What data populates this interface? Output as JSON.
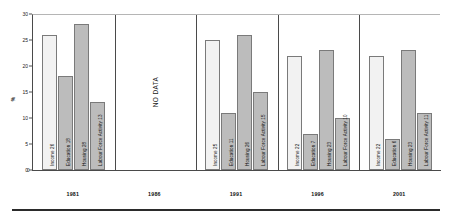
{
  "chart_data": {
    "type": "bar",
    "title": "",
    "xlabel": "",
    "ylabel": "%",
    "ylim": [
      0,
      30
    ],
    "ytick_labels": [
      "0",
      "5",
      "10",
      "15",
      "20",
      "25",
      "30"
    ],
    "ytick_values": [
      0,
      5,
      10,
      15,
      20,
      25,
      30
    ],
    "grid": false,
    "legend_position": "none",
    "categories": [
      "Income",
      "Education",
      "Housing",
      "Labour Force Activity"
    ],
    "groups": [
      {
        "year": "1981",
        "has_data": true,
        "bars": [
          {
            "label": "Income",
            "value": 26,
            "text": "Income  26",
            "shade": "light"
          },
          {
            "label": "Education",
            "value": 18,
            "text": "Education  18",
            "shade": "dark"
          },
          {
            "label": "Housing",
            "value": 28,
            "text": "Housing  28",
            "shade": "dark"
          },
          {
            "label": "Labour Force Activity",
            "value": 13,
            "text": "Labour Force Activity  13",
            "shade": "dark"
          }
        ]
      },
      {
        "year": "1986",
        "has_data": false,
        "no_data_text": "NO DATA",
        "bars": []
      },
      {
        "year": "1991",
        "has_data": true,
        "bars": [
          {
            "label": "Income",
            "value": 25,
            "text": "Income  25",
            "shade": "light"
          },
          {
            "label": "Education",
            "value": 11,
            "text": "Education  11",
            "shade": "dark"
          },
          {
            "label": "Housing",
            "value": 26,
            "text": "Housing  26",
            "shade": "dark"
          },
          {
            "label": "Labour Force Activity",
            "value": 15,
            "text": "Labour Force Activity  15",
            "shade": "dark"
          }
        ]
      },
      {
        "year": "1996",
        "has_data": true,
        "bars": [
          {
            "label": "Income",
            "value": 22,
            "text": "Income  22",
            "shade": "light"
          },
          {
            "label": "Education",
            "value": 7,
            "text": "Education  7",
            "shade": "dark"
          },
          {
            "label": "Housing",
            "value": 23,
            "text": "Housing  23",
            "shade": "dark"
          },
          {
            "label": "Labour Force Activity",
            "value": 10,
            "text": "Labour Force Activity  10",
            "shade": "dark"
          }
        ]
      },
      {
        "year": "2001",
        "has_data": true,
        "bars": [
          {
            "label": "Income",
            "value": 22,
            "text": "Income  22",
            "shade": "light"
          },
          {
            "label": "Education",
            "value": 6,
            "text": "Education  6",
            "shade": "dark"
          },
          {
            "label": "Housing",
            "value": 23,
            "text": "Housing  23",
            "shade": "dark"
          },
          {
            "label": "Labour Force Activity",
            "value": 11,
            "text": "Labour Force Activity  11",
            "shade": "dark"
          }
        ]
      }
    ],
    "colors": {
      "bar_light": "#f2f2f2",
      "bar_dark": "#bcbcbc",
      "bar_border": "#7a7a7a",
      "axis": "#4a4a4a",
      "text": "#111111",
      "background": "#ffffff"
    },
    "axis_origin_label": "0"
  }
}
